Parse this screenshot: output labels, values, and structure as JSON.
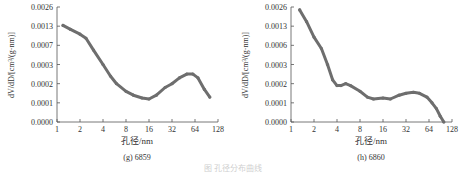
{
  "chart_data": [
    {
      "type": "line",
      "title": "(g) 6859",
      "xlabel": "孔径/nm",
      "ylabel": "dV/dD/[cm³/(g·nm)]",
      "x_scale": "log2",
      "xlim": [
        1,
        128
      ],
      "x_ticks": [
        "1",
        "2",
        "4",
        "8",
        "16",
        "32",
        "64",
        "128"
      ],
      "y_scale": "non-uniform (evenly spaced labels)",
      "y_ticks": [
        "0.0000",
        "0.0001",
        "0.0002",
        "0.0003",
        "0.0007",
        "0.0013",
        "0.0026"
      ],
      "grid": false,
      "legend": null,
      "series": [
        {
          "name": "6859",
          "x": [
            1.2,
            1.5,
            2.0,
            2.4,
            3.0,
            4.0,
            5.0,
            6.0,
            8.0,
            10.0,
            13.0,
            16.0,
            20.0,
            26.0,
            32.0,
            40.0,
            50.0,
            60.0,
            70.0,
            85.0,
            100.0
          ],
          "y": [
            0.00135,
            0.0012,
            0.00105,
            0.00092,
            0.0006,
            0.0003,
            0.00024,
            0.0002,
            0.00016,
            0.00014,
            0.000125,
            0.00012,
            0.00014,
            0.00018,
            0.0002,
            0.00023,
            0.00025,
            0.00025,
            0.00023,
            0.00017,
            0.00013
          ]
        }
      ]
    },
    {
      "type": "line",
      "title": "(h) 6860",
      "xlabel": "孔径/nm",
      "ylabel": "dV/dD/[cm³/(g·nm)]",
      "x_scale": "log2",
      "xlim": [
        1,
        128
      ],
      "x_ticks": [
        "1",
        "2",
        "4",
        "8",
        "16",
        "32",
        "64",
        "128"
      ],
      "y_scale": "non-uniform (evenly spaced labels)",
      "y_ticks": [
        "0.0000",
        "0.0001",
        "0.0002",
        "0.0006",
        "0.0003",
        "0.0002",
        "0.0001",
        "0.0000"
      ],
      "y_ticks_display": [
        "0.0000",
        "0.0001",
        "0.0002",
        "0.0003",
        "0.0006",
        "0.0013",
        "0.0026"
      ],
      "grid": false,
      "legend": null,
      "series": [
        {
          "name": "6860",
          "x": [
            1.3,
            1.6,
            2.0,
            2.5,
            3.0,
            3.5,
            4.0,
            4.5,
            5.2,
            6.0,
            8.0,
            10.0,
            12.0,
            16.0,
            20.0,
            26.0,
            32.0,
            40.0,
            48.0,
            60.0,
            70.0,
            80.0,
            90.0,
            100.0
          ],
          "y": [
            0.0024,
            0.0016,
            0.0009,
            0.00055,
            0.0003,
            0.00022,
            0.00019,
            0.00019,
            0.0002,
            0.00019,
            0.00016,
            0.00013,
            0.00012,
            0.000125,
            0.00012,
            0.00014,
            0.00015,
            0.000155,
            0.00015,
            0.00013,
            0.0001,
            7e-05,
            3e-05,
            0.0
          ]
        }
      ]
    }
  ],
  "panels": [
    {
      "ylabel": "dV/dD/[cm³/(g·nm)]",
      "xlabel": "孔径/nm",
      "caption": "(g)  6859",
      "y_ticks": [
        "0.0000",
        "0.0001",
        "0.0002",
        "0.0003",
        "0.0007",
        "0.0013",
        "0.0026"
      ],
      "x_ticks": [
        "1",
        "2",
        "4",
        "8",
        "16",
        "32",
        "64",
        "128"
      ]
    },
    {
      "ylabel": "dV/dD/[cm³/(g·nm)]",
      "xlabel": "孔径/nm",
      "caption": "(h)  6860",
      "y_ticks": [
        "0.0000",
        "0.0001",
        "0.0002",
        "0.0003",
        "0.0006",
        "0.0013",
        "0.0026"
      ],
      "x_ticks": [
        "1",
        "2",
        "4",
        "8",
        "16",
        "32",
        "64",
        "128"
      ]
    }
  ],
  "figure_caption": "图 孔径分布曲线",
  "colors": {
    "series": "#6e6e6e",
    "axis": "#555555",
    "text": "#333333"
  }
}
